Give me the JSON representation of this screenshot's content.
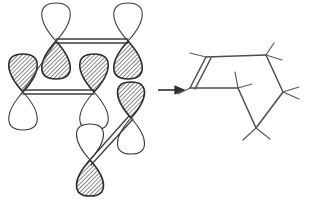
{
  "figure": {
    "background_color": "#ffffff",
    "width": 314,
    "height": 208,
    "colors": {
      "lobe_outline": "#2b2b2b",
      "lobe_empty_outline": "#3a3a3a",
      "lobe_fill_hatch": "#6d6d6d",
      "lobe_empty_fill": "#ffffff",
      "bond": "#3d3d3d",
      "skeleton": "#4d4d55",
      "arrow": "#2f2f2f"
    }
  },
  "chart_data": {
    "type": "diagram",
    "xlabel": "",
    "ylabel": "",
    "panels": [
      {
        "name": "orbital-panel",
        "label": "p-orbital overlap representation",
        "orbitals": [
          {
            "id": "orbital-top-left",
            "cx": 56,
            "cy": 41,
            "angle": 0,
            "filled_lobe": "down",
            "length": 38
          },
          {
            "id": "orbital-top-right",
            "cx": 128,
            "cy": 41,
            "angle": 0,
            "filled_lobe": "down",
            "length": 38
          },
          {
            "id": "orbital-mid-left",
            "cx": 23,
            "cy": 92,
            "angle": 0,
            "filled_lobe": "up",
            "length": 38
          },
          {
            "id": "orbital-mid-center",
            "cx": 94,
            "cy": 92,
            "angle": 0,
            "filled_lobe": "up",
            "length": 38
          },
          {
            "id": "orbital-lower-right",
            "cx": 131,
            "cy": 118,
            "angle": 0,
            "filled_lobe": "up",
            "length": 36
          },
          {
            "id": "orbital-bottom",
            "cx": 90,
            "cy": 160,
            "angle": 0,
            "filled_lobe": "down",
            "length": 36
          }
        ],
        "bonds": [
          {
            "id": "bond-top",
            "from": "orbital-top-left",
            "to": "orbital-top-right",
            "style": "double-thin"
          },
          {
            "id": "bond-middle",
            "from": "orbital-mid-left",
            "to": "orbital-mid-center",
            "style": "double-thin"
          },
          {
            "id": "bond-diagonal-upper",
            "from": "orbital-mid-left",
            "to": "orbital-top-left",
            "style": "single"
          },
          {
            "id": "bond-diagonal-lower",
            "from": "orbital-bottom",
            "to": "orbital-lower-right",
            "style": "double-thin"
          }
        ]
      },
      {
        "name": "skeletal-panel",
        "label": "Skeletal line structure with C=C double bond",
        "vertices": [
          {
            "id": "v1",
            "x": 206,
            "y": 57
          },
          {
            "id": "v2",
            "x": 266,
            "y": 55
          },
          {
            "id": "v3",
            "x": 283,
            "y": 92
          },
          {
            "id": "v4",
            "x": 238,
            "y": 88
          },
          {
            "id": "v5",
            "x": 190,
            "y": 88
          },
          {
            "id": "v6",
            "x": 256,
            "y": 128
          }
        ],
        "bonds": [
          {
            "id": "skel-double-bond",
            "from": "v1",
            "to": "v5",
            "order": 2
          },
          {
            "id": "skel-bond-top",
            "from": "v1",
            "to": "v2",
            "order": 1
          },
          {
            "id": "skel-bond-right",
            "from": "v2",
            "to": "v3",
            "order": 1
          },
          {
            "id": "skel-bond-mid",
            "from": "v5",
            "to": "v4",
            "order": 1
          },
          {
            "id": "skel-bond-v4-v6",
            "from": "v4",
            "to": "v6",
            "order": 1
          },
          {
            "id": "skel-bond-v3-v6",
            "from": "v3",
            "to": "v6",
            "order": 1
          }
        ],
        "methyl_stubs": 12
      }
    ],
    "arrow": {
      "id": "reaction-arrow",
      "direction": "right",
      "x_start": 158,
      "x_end": 188,
      "y": 90,
      "label": ""
    },
    "legend": [],
    "annotations": []
  }
}
